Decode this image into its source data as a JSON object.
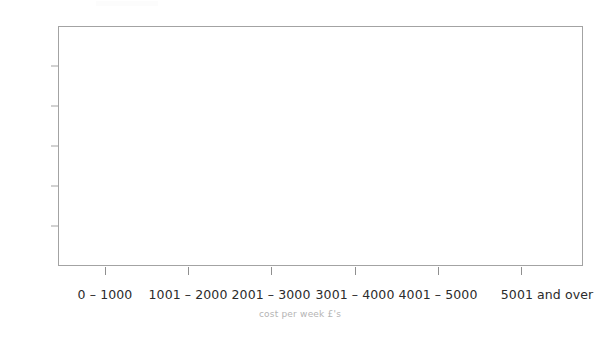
{
  "chart_data": {
    "type": "bar",
    "title": "",
    "subtitle": "",
    "xlabel": "cost per week £'s",
    "ylabel": "",
    "categories": [
      "0 – 1000",
      "1001 – 2000",
      "2001 – 3000",
      "3001 – 4000",
      "4001 – 5000",
      "5001 and over"
    ],
    "values": [
      0,
      0,
      0,
      0,
      0,
      0
    ],
    "series": [
      {
        "name": "",
        "values": [
          0,
          0,
          0,
          0,
          0,
          0
        ]
      }
    ],
    "ylim": [
      0,
      60
    ],
    "y_ticks": [
      0,
      10,
      20,
      30,
      40,
      50,
      60
    ],
    "y_tick_labels": [
      "0",
      "10",
      "20",
      "30",
      "40",
      "50",
      "60"
    ],
    "grid": false,
    "legend": false,
    "legend_position": "none",
    "annotations": []
  },
  "style": {
    "frame_color": "#a3a3a3",
    "tick_color": "#8f8f8f",
    "tick_label_color": "#2b2b2b",
    "axis_title_color": "#b4b4b4",
    "background_color": "#ffffff",
    "bar_color": "#5b9bd5"
  }
}
